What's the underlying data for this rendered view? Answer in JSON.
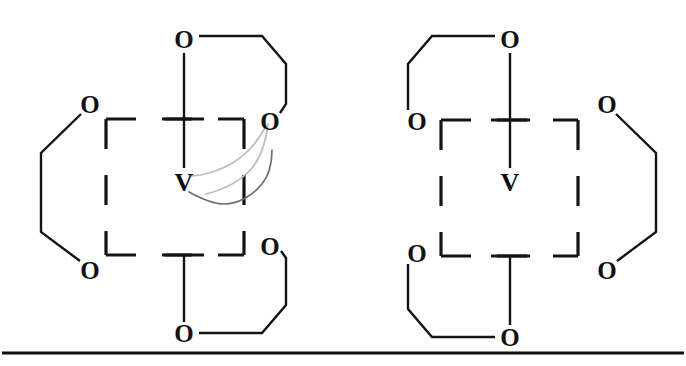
{
  "figure": {
    "background_color": "#ffffff",
    "ink_color": "#111111",
    "artifact_color": "#b9b9b9",
    "rule": {
      "name": "bottom-rule",
      "x1": 2,
      "y1": 353,
      "x2": 684,
      "y2": 353,
      "thickness": 3
    }
  },
  "structures": [
    {
      "id": "left-complex",
      "label": "left vanadium complex",
      "metal": {
        "symbol": "V",
        "x": 184,
        "y": 182
      },
      "oxo": {
        "symbol": "O",
        "x": 184,
        "y": 39
      },
      "oxygens": [
        {
          "name": "o-top-apex",
          "symbol": "O",
          "x": 184,
          "y": 39
        },
        {
          "name": "o-left-upper",
          "symbol": "O",
          "x": 90,
          "y": 104
        },
        {
          "name": "o-left-lower",
          "symbol": "O",
          "x": 90,
          "y": 270
        },
        {
          "name": "o-right-upper",
          "symbol": "O",
          "x": 270,
          "y": 121
        },
        {
          "name": "o-right-lower",
          "symbol": "O",
          "x": 270,
          "y": 246
        },
        {
          "name": "o-bottom-apex",
          "symbol": "O",
          "x": 184,
          "y": 333
        }
      ],
      "square": {
        "x": 106,
        "y": 119,
        "w": 138,
        "h": 136
      },
      "has_scan_artifact": true
    },
    {
      "id": "right-complex",
      "label": "right vanadium complex",
      "metal": {
        "symbol": "V",
        "x": 510,
        "y": 182
      },
      "oxo": {
        "symbol": "O",
        "x": 510,
        "y": 39
      },
      "oxygens": [
        {
          "name": "o-top-apex",
          "symbol": "O",
          "x": 510,
          "y": 39
        },
        {
          "name": "o-left-upper",
          "symbol": "O",
          "x": 417,
          "y": 121
        },
        {
          "name": "o-left-lower",
          "symbol": "O",
          "x": 417,
          "y": 253
        },
        {
          "name": "o-right-upper",
          "symbol": "O",
          "x": 607,
          "y": 104
        },
        {
          "name": "o-right-lower",
          "symbol": "O",
          "x": 607,
          "y": 270
        },
        {
          "name": "o-bottom-apex",
          "symbol": "O",
          "x": 510,
          "y": 337
        }
      ],
      "square": {
        "x": 441,
        "y": 120,
        "w": 137,
        "h": 136
      },
      "has_scan_artifact": false
    }
  ],
  "atom_labels": {
    "oxygen": "O",
    "vanadium": "V"
  }
}
